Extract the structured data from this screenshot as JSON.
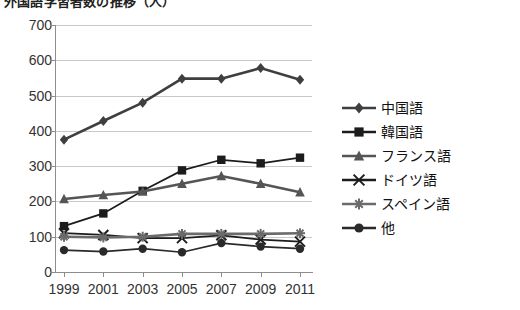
{
  "title": {
    "text": "外国語学習者数の推移（人）",
    "clipped": true
  },
  "chart_data": {
    "type": "line",
    "title": "外国語学習者数の推移（人）",
    "xlabel": "",
    "ylabel": "",
    "categories": [
      "1999",
      "2001",
      "2003",
      "2005",
      "2007",
      "2009",
      "2011"
    ],
    "x_tick_labels": [
      "1999",
      "2001",
      "2003",
      "2005",
      "2007",
      "2009",
      "2011"
    ],
    "y_tick_labels": [
      "0",
      "100",
      "200",
      "300",
      "400",
      "500",
      "600",
      "700"
    ],
    "ylim": [
      0,
      700
    ],
    "y_step": 100,
    "grid": "horizontal",
    "legend_position": "right",
    "series": [
      {
        "name": "中国語",
        "marker": "diamond",
        "color": "#3f3f3f",
        "values": [
          375,
          428,
          480,
          548,
          548,
          578,
          545
        ]
      },
      {
        "name": "韓国語",
        "marker": "square",
        "color": "#1c1c1c",
        "values": [
          130,
          166,
          230,
          288,
          318,
          308,
          324
        ]
      },
      {
        "name": "フランス語",
        "marker": "triangle",
        "color": "#555555",
        "values": [
          207,
          218,
          228,
          250,
          272,
          250,
          226
        ]
      },
      {
        "name": "ドイツ語",
        "marker": "cross",
        "color": "#1c1c1c",
        "values": [
          110,
          105,
          96,
          96,
          104,
          92,
          86
        ]
      },
      {
        "name": "スペイン語",
        "marker": "asterisk",
        "color": "#6b6b6b",
        "values": [
          100,
          98,
          100,
          108,
          108,
          108,
          110
        ]
      },
      {
        "name": "他",
        "marker": "circle",
        "color": "#2a2a2a",
        "values": [
          62,
          58,
          66,
          56,
          82,
          72,
          66
        ]
      }
    ]
  },
  "legend": {
    "items": [
      {
        "label": "中国語",
        "marker": "diamond"
      },
      {
        "label": "韓国語",
        "marker": "square"
      },
      {
        "label": "フランス語",
        "marker": "triangle"
      },
      {
        "label": "ドイツ語",
        "marker": "cross"
      },
      {
        "label": "スペイン語",
        "marker": "asterisk"
      },
      {
        "label": "他",
        "marker": "circle"
      }
    ]
  }
}
